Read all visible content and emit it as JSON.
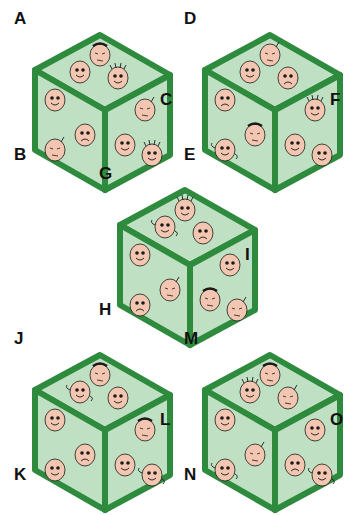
{
  "colors": {
    "edge": "#2e8b3e",
    "face": "#bfe0c2",
    "skin": "#f2c6b0",
    "ink": "#1a1a1a"
  },
  "cubes": [
    {
      "id": "cube-abc",
      "x": 10,
      "y": 15,
      "labels": {
        "top": "A",
        "left": "B",
        "right": "C"
      },
      "faces": {
        "top": [
          "neutral-hat",
          "smile",
          "smile-spiky"
        ],
        "left": [
          "smile",
          "sad",
          "neutral-antenna"
        ],
        "right": [
          "neutral-antenna",
          "smile",
          "smile-spiky"
        ]
      }
    },
    {
      "id": "cube-def",
      "x": 180,
      "y": 15,
      "labels": {
        "top": "D",
        "left": "E",
        "right": "F"
      },
      "faces": {
        "top": [
          "neutral-antenna",
          "smile",
          "sad"
        ],
        "left": [
          "sad",
          "neutral-hat",
          "smile-curly"
        ],
        "right": [
          "smile-spiky",
          "smile",
          "smile"
        ]
      }
    },
    {
      "id": "cube-ghi",
      "x": 95,
      "y": 170,
      "labels": {
        "top": "G",
        "left": "H",
        "right": "I"
      },
      "faces": {
        "top": [
          "smile-spiky",
          "smile-curly",
          "sad"
        ],
        "left": [
          "smile",
          "neutral-antenna",
          "sad"
        ],
        "right": [
          "smile",
          "neutral-hat",
          "neutral-antenna"
        ]
      }
    },
    {
      "id": "cube-jkl",
      "x": 10,
      "y": 335,
      "labels": {
        "top": "J",
        "left": "K",
        "right": "L"
      },
      "faces": {
        "top": [
          "neutral-hat",
          "smile-curly",
          "smile"
        ],
        "left": [
          "smile",
          "sad",
          "smile"
        ],
        "right": [
          "neutral-hat",
          "smile",
          "smile-curly"
        ]
      }
    },
    {
      "id": "cube-mno",
      "x": 180,
      "y": 335,
      "labels": {
        "top": "M",
        "left": "N",
        "right": "O"
      },
      "faces": {
        "top": [
          "neutral-hat",
          "smile-spiky",
          "neutral-antenna"
        ],
        "left": [
          "smile",
          "neutral-antenna",
          "smile-curly"
        ],
        "right": [
          "smile",
          "sad",
          "smile-curly"
        ]
      }
    }
  ]
}
